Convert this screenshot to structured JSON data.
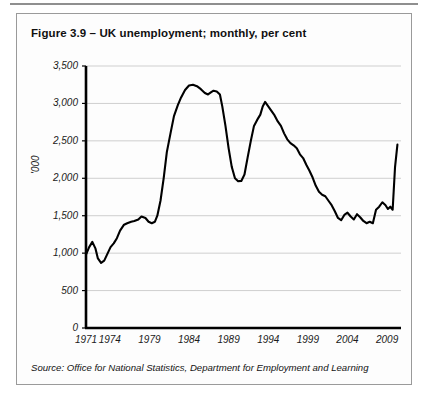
{
  "figure": {
    "title": "Figure 3.9 – UK unemployment; monthly, per cent",
    "source": "Source: Office for National Statistics, Department for Employment and Learning"
  },
  "chart_data": {
    "type": "line",
    "title": "Figure 3.9 – UK unemployment; monthly, per cent",
    "xlabel": "",
    "ylabel": "'000",
    "xlim": [
      1971,
      2010.5
    ],
    "ylim": [
      0,
      3500
    ],
    "grid": true,
    "legend": false,
    "y_ticks": [
      0,
      500,
      1000,
      1500,
      2000,
      2500,
      3000,
      3500
    ],
    "y_tick_labels": [
      "0",
      "500",
      "1,000",
      "1,500",
      "2,000",
      "2,500",
      "3,000",
      "3,500"
    ],
    "x_ticks": [
      1971,
      1974,
      1979,
      1984,
      1989,
      1994,
      1999,
      2004,
      2009
    ],
    "x_tick_labels": [
      "1971",
      "1974",
      "1979",
      "1984",
      "1989",
      "1994",
      "1999",
      "2004",
      "2009"
    ],
    "line_color": "#000000",
    "series": [
      {
        "name": "UK unemployment",
        "units": "thousands",
        "x": [
          1971.0,
          1971.4,
          1971.8,
          1972.2,
          1972.5,
          1972.9,
          1973.3,
          1973.7,
          1974.1,
          1974.5,
          1974.9,
          1975.3,
          1975.8,
          1976.2,
          1976.7,
          1977.1,
          1977.6,
          1978.0,
          1978.5,
          1978.9,
          1979.3,
          1979.7,
          1980.0,
          1980.4,
          1980.8,
          1981.2,
          1981.7,
          1982.1,
          1982.6,
          1983.0,
          1983.5,
          1984.0,
          1984.5,
          1985.0,
          1985.5,
          1986.0,
          1986.4,
          1986.8,
          1987.1,
          1987.5,
          1987.9,
          1988.2,
          1988.6,
          1989.0,
          1989.4,
          1989.8,
          1990.2,
          1990.6,
          1991.0,
          1991.4,
          1991.8,
          1992.2,
          1992.6,
          1993.0,
          1993.3,
          1993.6,
          1994.0,
          1994.4,
          1994.8,
          1995.2,
          1995.6,
          1996.0,
          1996.4,
          1996.8,
          1997.2,
          1997.6,
          1998.0,
          1998.4,
          1998.8,
          1999.2,
          1999.6,
          2000.0,
          2000.4,
          2000.8,
          2001.2,
          2001.6,
          2002.0,
          2002.4,
          2002.8,
          2003.2,
          2003.6,
          2004.0,
          2004.4,
          2004.8,
          2005.2,
          2005.6,
          2006.0,
          2006.4,
          2006.8,
          2007.2,
          2007.6,
          2008.0,
          2008.4,
          2008.8,
          2009.1,
          2009.4,
          2009.7,
          2010.0,
          2010.3
        ],
        "y": [
          980,
          1080,
          1150,
          1060,
          930,
          870,
          900,
          990,
          1080,
          1130,
          1200,
          1300,
          1380,
          1400,
          1420,
          1430,
          1450,
          1490,
          1470,
          1420,
          1400,
          1420,
          1500,
          1700,
          2000,
          2350,
          2620,
          2830,
          2980,
          3080,
          3180,
          3240,
          3250,
          3230,
          3190,
          3140,
          3120,
          3150,
          3170,
          3160,
          3120,
          2960,
          2700,
          2400,
          2150,
          2000,
          1960,
          1965,
          2050,
          2280,
          2500,
          2700,
          2780,
          2850,
          2960,
          3020,
          2960,
          2900,
          2840,
          2760,
          2700,
          2600,
          2520,
          2470,
          2440,
          2400,
          2320,
          2270,
          2180,
          2100,
          2010,
          1900,
          1820,
          1780,
          1760,
          1700,
          1640,
          1560,
          1470,
          1440,
          1510,
          1540,
          1490,
          1450,
          1520,
          1480,
          1430,
          1400,
          1420,
          1400,
          1580,
          1620,
          1680,
          1640,
          1590,
          1620,
          1580,
          2150,
          2450
        ]
      }
    ],
    "annotations": []
  },
  "axis": {
    "y_unit_label": "'000"
  }
}
